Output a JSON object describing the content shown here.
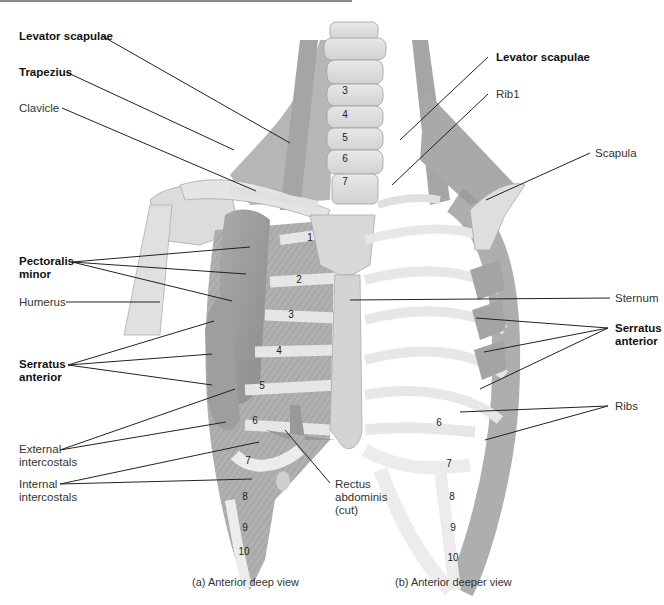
{
  "figure": {
    "views": [
      {
        "id": "a",
        "caption": "(a) Anterior deep view"
      },
      {
        "id": "b",
        "caption": "(b) Anterior deeper view"
      }
    ],
    "labels_left": [
      {
        "id": "levator-scapulae-left",
        "text": "Levator scapulae",
        "bold": true
      },
      {
        "id": "trapezius",
        "text": "Trapezius",
        "bold": true
      },
      {
        "id": "clavicle",
        "text": "Clavicle",
        "bold": false
      },
      {
        "id": "pectoralis-minor",
        "line1": "Pectoralis",
        "line2": "minor",
        "bold": true
      },
      {
        "id": "humerus",
        "text": "Humerus",
        "bold": false
      },
      {
        "id": "serratus-anterior-left",
        "line1": "Serratus",
        "line2": "anterior",
        "bold": true
      },
      {
        "id": "external-intercostals",
        "line1": "External",
        "line2": "intercostals",
        "bold": false
      },
      {
        "id": "internal-intercostals",
        "line1": "Internal",
        "line2": "intercostals",
        "bold": false
      }
    ],
    "labels_center": [
      {
        "id": "rectus-abdominis",
        "line1": "Rectus",
        "line2": "abdominis",
        "line3": "(cut)",
        "bold": false
      }
    ],
    "labels_right": [
      {
        "id": "levator-scapulae-right",
        "text": "Levator scapulae",
        "bold": true
      },
      {
        "id": "rib1",
        "text": "Rib1",
        "bold": false
      },
      {
        "id": "scapula",
        "text": "Scapula",
        "bold": false
      },
      {
        "id": "sternum",
        "text": "Sternum",
        "bold": false
      },
      {
        "id": "serratus-anterior-right",
        "line1": "Serratus",
        "line2": "anterior",
        "bold": true
      },
      {
        "id": "ribs",
        "text": "Ribs",
        "bold": false
      }
    ],
    "vertebra_numbers": [
      "3",
      "4",
      "5",
      "6",
      "7"
    ],
    "rib_numbers_left": [
      "1",
      "2",
      "3",
      "4",
      "5",
      "6",
      "7",
      "8",
      "9",
      "10"
    ],
    "rib_numbers_right": [
      "6",
      "7",
      "8",
      "9",
      "10"
    ]
  }
}
